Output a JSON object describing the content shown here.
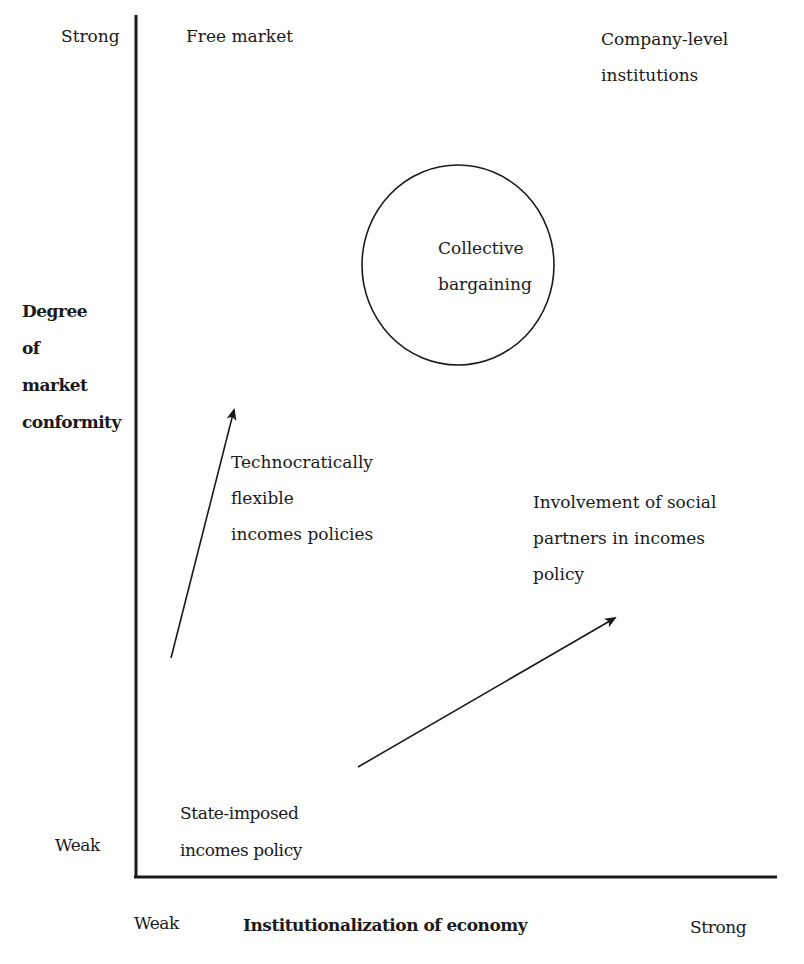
{
  "diagram": {
    "y_axis": {
      "title_lines": [
        "Degree",
        "of",
        "market",
        "conformity"
      ],
      "strong_label": "Strong",
      "weak_label": "Weak"
    },
    "x_axis": {
      "title": "Institutionalization of economy",
      "weak_label": "Weak",
      "strong_label": "Strong"
    },
    "regions": {
      "free_market": "Free market",
      "company_level": [
        "Company-level",
        "institutions"
      ],
      "collective_bargaining": [
        "Collective",
        "bargaining"
      ],
      "technocratic": [
        "Technocratically",
        "flexible",
        "incomes policies"
      ],
      "social_partners": [
        "Involvement of social",
        "partners in incomes",
        "policy"
      ],
      "state_imposed": [
        "State-imposed",
        "incomes policy"
      ]
    },
    "colors": {
      "ink": "#1a1a1a",
      "background": "#ffffff"
    }
  }
}
